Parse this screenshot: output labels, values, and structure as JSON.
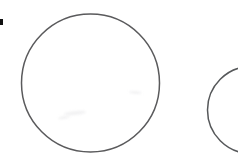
{
  "canvas": {
    "width": 238,
    "height": 159,
    "background_color": "#ffffff",
    "title": "Two overlapping outlined circles line drawing"
  },
  "style": {
    "stroke_color": "#5a5a5c",
    "stroke_width": 1.5,
    "fill": "none",
    "mark_color": "#111111",
    "smudge_color": "#f2f2f3"
  },
  "shapes": [
    {
      "id": "large-circle",
      "type": "circle",
      "label": "Large circle",
      "cx": 90.5,
      "cy": 83,
      "r": 69,
      "stroke": "#5a5a5c",
      "stroke_width": 1.5
    },
    {
      "id": "small-circle",
      "type": "circle",
      "label": "Partially cropped circle at right edge",
      "cx": 251,
      "cy": 110,
      "r": 43.5,
      "stroke": "#56585a",
      "stroke_width": 1.5
    }
  ],
  "marks": [
    {
      "id": "corner-mark",
      "label": "Small black rectangular mark",
      "x": 0,
      "y": 19,
      "width": 3,
      "height": 6,
      "color": "#111111"
    }
  ],
  "artifacts": [
    {
      "id": "smudge-a",
      "label": "faint gray smudge"
    },
    {
      "id": "smudge-b",
      "label": "faint gray smudge"
    },
    {
      "id": "smudge-c",
      "label": "faint gray smudge"
    }
  ]
}
